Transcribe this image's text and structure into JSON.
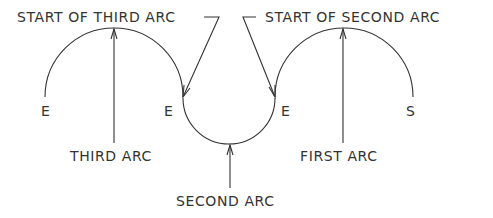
{
  "diagram": {
    "type": "arc-path-diagram",
    "stroke_color": "#333333",
    "background": "#ffffff",
    "labels": {
      "start_of_third_arc": "START OF THIRD ARC",
      "start_of_second_arc": "START OF SECOND ARC",
      "third_arc": "THIRD ARC",
      "second_arc": "SECOND ARC",
      "first_arc": "FIRST ARC",
      "end_left": "E",
      "end_mid_left": "E",
      "end_mid_right": "E",
      "start": "S"
    },
    "arcs": [
      {
        "name": "first arc",
        "shape": "upper semicircle",
        "from": "S",
        "to": "E (mid right)"
      },
      {
        "name": "second arc",
        "shape": "lower semicircle",
        "from": "E (mid right)",
        "to": "E (mid left)"
      },
      {
        "name": "third arc",
        "shape": "upper semicircle",
        "from": "E (mid left)",
        "to": "E (left)"
      }
    ]
  }
}
